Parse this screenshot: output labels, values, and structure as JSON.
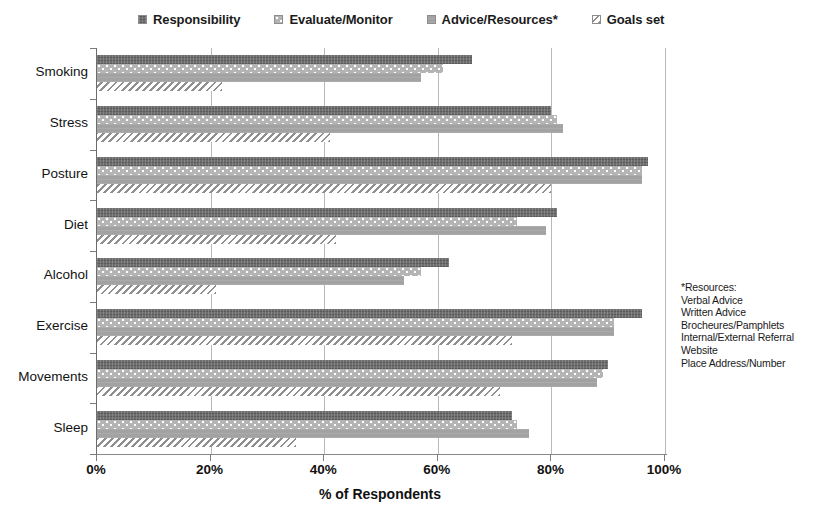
{
  "chart_data": {
    "type": "bar",
    "orientation": "horizontal",
    "title": "",
    "xlabel": "% of Respondents",
    "ylabel": "",
    "xlim": [
      0,
      100
    ],
    "xticks": [
      "0%",
      "20%",
      "40%",
      "60%",
      "80%",
      "100%"
    ],
    "xtick_values": [
      0,
      20,
      40,
      60,
      80,
      100
    ],
    "grid": "vertical",
    "legend_position": "top",
    "categories": [
      "Smoking",
      "Stress",
      "Posture",
      "Diet",
      "Alcohol",
      "Exercise",
      "Movements",
      "Sleep"
    ],
    "series": [
      {
        "name": "Responsibility",
        "pattern": "dark-solid",
        "color": "#6e6e6e",
        "values": [
          66,
          80,
          97,
          81,
          62,
          96,
          90,
          73
        ]
      },
      {
        "name": "Evaluate/Monitor",
        "pattern": "dotted",
        "color": "#b4b4b4",
        "values": [
          61,
          81,
          96,
          74,
          57,
          91,
          89,
          74
        ]
      },
      {
        "name": "Advice/Resources*",
        "pattern": "gray-solid",
        "color": "#a2a2a2",
        "values": [
          57,
          82,
          96,
          79,
          54,
          91,
          88,
          76
        ]
      },
      {
        "name": "Goals set",
        "pattern": "diagonal-hatch",
        "color": "#8f8f8f",
        "values": [
          22,
          41,
          80,
          42,
          21,
          73,
          71,
          35
        ]
      }
    ],
    "annotation": {
      "title": "*Resources:",
      "items": [
        "Verbal Advice",
        "Written Advice",
        "Brocheures/Pamphlets",
        "Internal/External Referral",
        "Website",
        "Place Address/Number"
      ]
    }
  }
}
